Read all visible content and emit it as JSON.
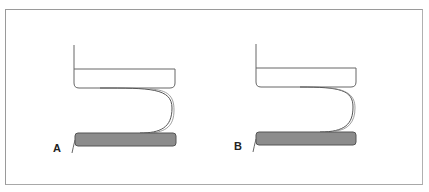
{
  "figure": {
    "panels": [
      {
        "label": "A",
        "box_fill": "#ffffff",
        "bar_fill": "#8c8c8c",
        "stroke": "#555555"
      },
      {
        "label": "B",
        "box_fill": "#ffffff",
        "bar_fill": "#8c8c8c",
        "stroke": "#555555"
      }
    ],
    "frame_color": "#9a9a9a"
  }
}
